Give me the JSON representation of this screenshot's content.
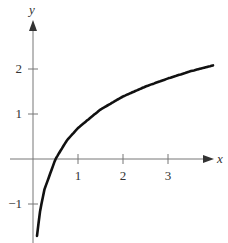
{
  "chart_data": {
    "type": "line",
    "title": "",
    "xlabel": "x",
    "ylabel": "y",
    "xlim": [
      -0.6,
      4.0
    ],
    "ylim": [
      -1.7,
      2.8
    ],
    "x_ticks": [
      1,
      2,
      3
    ],
    "y_ticks": [
      -1,
      1,
      2
    ],
    "x_tick_labels": [
      "1",
      "2",
      "3"
    ],
    "y_tick_labels": [
      "−1",
      "1",
      "2"
    ],
    "grid": false,
    "legend": null,
    "series": [
      {
        "name": "y = ln(2x)",
        "x": [
          0.09,
          0.15,
          0.25,
          0.5,
          0.75,
          1.0,
          1.5,
          2.0,
          2.5,
          3.0,
          3.5,
          4.0
        ],
        "values": [
          -1.71,
          -1.2,
          -0.69,
          0.0,
          0.41,
          0.69,
          1.1,
          1.39,
          1.61,
          1.79,
          1.95,
          2.08
        ]
      }
    ]
  },
  "labels": {
    "x_axis": "x",
    "y_axis": "y",
    "x_tick_1": "1",
    "x_tick_2": "2",
    "x_tick_3": "3",
    "y_tick_2": "2",
    "y_tick_1": "1",
    "y_tick_neg1": "−1"
  }
}
